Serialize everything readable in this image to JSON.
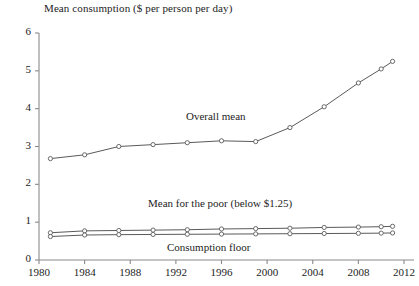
{
  "chart_data": {
    "type": "line",
    "title": "",
    "ylabel": "Mean consumption ($ per person per day)",
    "xlabel": "",
    "xlim": [
      1980,
      2012
    ],
    "ylim": [
      0,
      6
    ],
    "grid": false,
    "legend_position": "inline-annotations",
    "xticks": [
      1980,
      1984,
      1988,
      1992,
      1996,
      2000,
      2004,
      2008,
      2012
    ],
    "yticks": [
      0,
      1,
      2,
      3,
      4,
      5,
      6
    ],
    "series": [
      {
        "name": "Overall mean",
        "x": [
          1981,
          1984,
          1987,
          1990,
          1993,
          1996,
          1999,
          2002,
          2005,
          2008,
          2010,
          2011
        ],
        "values": [
          2.68,
          2.78,
          3.0,
          3.05,
          3.1,
          3.15,
          3.13,
          3.5,
          4.05,
          4.68,
          5.05,
          5.25
        ]
      },
      {
        "name": "Mean for the poor (below $1.25)",
        "x": [
          1981,
          1984,
          1987,
          1990,
          1993,
          1996,
          1999,
          2002,
          2005,
          2008,
          2010,
          2011
        ],
        "values": [
          0.72,
          0.77,
          0.78,
          0.79,
          0.8,
          0.82,
          0.83,
          0.84,
          0.86,
          0.87,
          0.88,
          0.89
        ]
      },
      {
        "name": "Consumption floor",
        "x": [
          1981,
          1984,
          1987,
          1990,
          1993,
          1996,
          1999,
          2002,
          2005,
          2008,
          2010,
          2011
        ],
        "values": [
          0.62,
          0.66,
          0.67,
          0.675,
          0.68,
          0.685,
          0.69,
          0.695,
          0.7,
          0.705,
          0.71,
          0.715
        ]
      }
    ],
    "annotations": [
      {
        "text": "Overall mean",
        "x_px": 186,
        "y_px": 110
      },
      {
        "text": "Mean for the poor (below $1.25)",
        "x_px": 148,
        "y_px": 197
      },
      {
        "text": "Consumption floor",
        "x_px": 167,
        "y_px": 241
      }
    ],
    "colors": {
      "line": "#5a5a5a",
      "marker_fill": "#ffffff",
      "marker_stroke": "#5a5a5a",
      "axis": "#8a8a8a",
      "text": "#1d1d1d"
    }
  }
}
